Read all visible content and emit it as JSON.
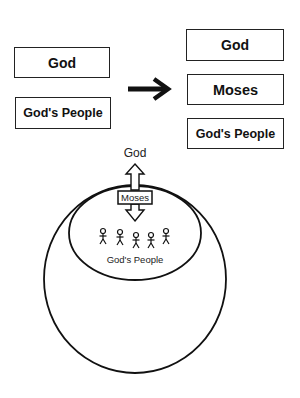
{
  "before": {
    "top_box": "God",
    "bottom_box": "God's People"
  },
  "transition": {
    "icon": "right-arrow-icon"
  },
  "after": {
    "top_box": "God",
    "middle_box": "Moses",
    "bottom_box": "God's People"
  },
  "illustration": {
    "god_label": "God",
    "mediator_label": "Moses",
    "people_label": "God's People",
    "people_count": 5,
    "icons": {
      "double_arrow": "vertical-double-arrow-icon",
      "person": "stick-figure-icon"
    }
  },
  "colors": {
    "stroke": "#222222",
    "background": "#ffffff"
  }
}
